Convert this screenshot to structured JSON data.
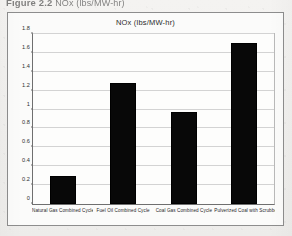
{
  "caption": {
    "number": "Figure 2.2",
    "rest": "NOx (lbs/MW-hr)",
    "full_text": "Figure 2.2   NOx  (lbs/MW-hr)",
    "note": "partially cropped at top edge of page"
  },
  "chart_data": {
    "type": "bar",
    "title": "NOx  (lbs/MW-hr)",
    "xlabel": "",
    "ylabel": "",
    "categories": [
      "Natural Gas Combined Cycle",
      "Fuel Oil Combined Cycle",
      "Coal Gas Combined Cycle",
      "Pulverized Coal with Scrubber"
    ],
    "values": [
      0.3,
      1.28,
      0.97,
      1.71
    ],
    "ylim": [
      0,
      1.8
    ],
    "ytick_values": [
      0,
      0.2,
      0.4,
      0.6,
      0.8,
      1,
      1.2,
      1.4,
      1.6,
      1.8
    ],
    "ytick_labels": [
      "0",
      "0.2",
      "0.4",
      "0.6",
      "0.8",
      "1",
      "1.2",
      "1.4",
      "1.6",
      "1.8"
    ],
    "grid": true,
    "legend": false,
    "bar_color": "#080808",
    "plot_background": "#fdfdfc",
    "gridline_color": "#d3d3d3",
    "axis_color": "#6f6f6f"
  }
}
